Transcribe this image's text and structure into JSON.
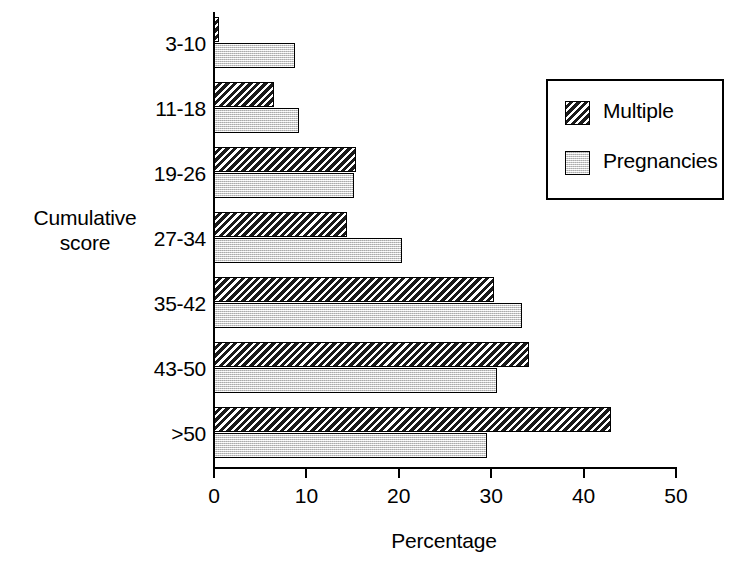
{
  "chart_data": {
    "type": "bar",
    "orientation": "horizontal",
    "title": "",
    "xlabel": "Percentage",
    "ylabel": "Cumulative score",
    "categories": [
      "3-10",
      "11-18",
      "19-26",
      "27-34",
      "35-42",
      "43-50",
      ">50"
    ],
    "series": [
      {
        "name": "Multiple",
        "values": [
          0.5,
          6.5,
          15.4,
          14.4,
          30.3,
          34.1,
          43.0
        ]
      },
      {
        "name": "Pregnancies",
        "values": [
          8.8,
          9.2,
          15.1,
          20.3,
          33.3,
          30.6,
          29.5
        ]
      }
    ],
    "xlim": [
      0,
      50
    ],
    "xticks": [
      0,
      10,
      20,
      30,
      40,
      50
    ],
    "xtick_labels": [
      "0",
      "10",
      "20",
      "30",
      "40",
      "50"
    ],
    "grid": false,
    "legend_position": "upper right",
    "legend_entries": [
      "Multiple",
      "Pregnancies"
    ]
  },
  "axes": {
    "y_title_line1": "Cumulative",
    "y_title_line2": "score",
    "x_title": "Percentage"
  },
  "legend": {
    "items": [
      {
        "label": "Multiple",
        "swatch": "hatch-diagonal-swatch"
      },
      {
        "label": "Pregnancies",
        "swatch": "light-gray-stipple-swatch"
      }
    ]
  },
  "colors": {
    "multiple_fill": "#1a1a1a",
    "pregnancies_fill": "#d9d9d9",
    "axis": "#000000",
    "background": "#ffffff"
  }
}
